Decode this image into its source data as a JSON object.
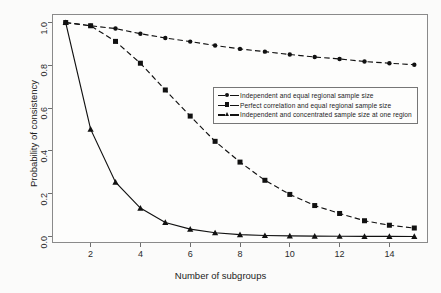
{
  "chart_data": {
    "type": "line",
    "title": "",
    "xlabel": "Number of subgroups",
    "ylabel": "Probability of consistency",
    "x": [
      1,
      2,
      3,
      4,
      5,
      6,
      7,
      8,
      9,
      10,
      11,
      12,
      13,
      14,
      15
    ],
    "xlim": [
      0.45,
      15.55
    ],
    "ylim": [
      -0.03,
      1.04
    ],
    "xticks": [
      2,
      4,
      6,
      8,
      10,
      12,
      14
    ],
    "xtick_labels": [
      "2",
      "4",
      "6",
      "8",
      "10",
      "12",
      "14"
    ],
    "yticks": [
      0.0,
      0.2,
      0.4,
      0.6,
      0.8,
      1.0
    ],
    "ytick_labels": [
      "0.0",
      "0.2",
      "0.4",
      "0.6",
      "0.8",
      "1.0"
    ],
    "grid": false,
    "legend_position": "center-right",
    "series": [
      {
        "name": "Independent and equal regional sample size",
        "marker": "circle",
        "linestyle": "dashed",
        "color": "#111111",
        "values": [
          1.0,
          0.985,
          0.972,
          0.948,
          0.928,
          0.911,
          0.893,
          0.877,
          0.864,
          0.851,
          0.839,
          0.83,
          0.818,
          0.81,
          0.803
        ]
      },
      {
        "name": "Perfect correlation and equal regional sample size",
        "marker": "square",
        "linestyle": "dashed",
        "color": "#111111",
        "values": [
          1.0,
          0.985,
          0.912,
          0.81,
          0.685,
          0.563,
          0.445,
          0.348,
          0.263,
          0.197,
          0.145,
          0.108,
          0.074,
          0.053,
          0.04
        ]
      },
      {
        "name": "Independent and concentrated sample size at one region",
        "marker": "triangle",
        "linestyle": "solid",
        "color": "#111111",
        "values": [
          1.0,
          0.502,
          0.254,
          0.133,
          0.066,
          0.035,
          0.018,
          0.009,
          0.005,
          0.003,
          0.002,
          0.0015,
          0.001,
          0.0008,
          0.0005
        ]
      }
    ]
  },
  "axes": {
    "x_label": "Number of subgroups",
    "y_label": "Probability of consistency"
  },
  "legend": {
    "entries": [
      {
        "label": "Independent and equal regional sample size",
        "marker": "circle"
      },
      {
        "label": "Perfect correlation and equal regional sample size",
        "marker": "square"
      },
      {
        "label": "Independent and concentrated sample size at one region",
        "marker": "triangle"
      }
    ]
  }
}
